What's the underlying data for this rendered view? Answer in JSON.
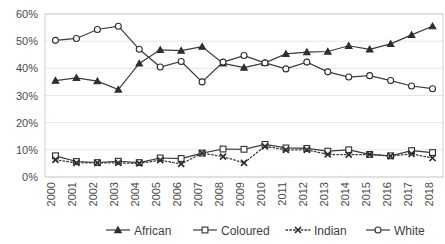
{
  "chart_data": {
    "type": "line",
    "title": "",
    "subtitle": "",
    "xlabel": "",
    "ylabel": "",
    "ylim": [
      0,
      60
    ],
    "ytick_labels": [
      "0%",
      "10%",
      "20%",
      "30%",
      "40%",
      "50%",
      "60%"
    ],
    "ytick_values": [
      0,
      10,
      20,
      30,
      40,
      50,
      60
    ],
    "grid": true,
    "legend_position": "bottom",
    "value_format": "percent",
    "categories": [
      "2000",
      "2001",
      "2002",
      "2003",
      "2004",
      "2005",
      "2006",
      "2007",
      "2008",
      "2009",
      "2010",
      "2011",
      "2012",
      "2013",
      "2014",
      "2015",
      "2016",
      "2017",
      "2018"
    ],
    "series": [
      {
        "name": "African",
        "marker": "triangle-filled",
        "line_style": "solid",
        "color": "#2e2e2e",
        "values": [
          35.5,
          36.5,
          35.3,
          32.2,
          41.8,
          46.8,
          46.5,
          48.0,
          41.8,
          40.3,
          42.0,
          45.3,
          46.0,
          46.2,
          48.3,
          47.0,
          49.0,
          52.3,
          55.5
        ]
      },
      {
        "name": "Coloured",
        "marker": "square-open",
        "line_style": "solid",
        "color": "#2e2e2e",
        "values": [
          7.8,
          5.7,
          5.3,
          5.8,
          5.3,
          7.0,
          6.8,
          8.8,
          10.3,
          10.2,
          12.0,
          10.7,
          10.5,
          9.5,
          10.0,
          8.3,
          7.8,
          9.7,
          9.0
        ]
      },
      {
        "name": "Indian",
        "marker": "x",
        "line_style": "dotted",
        "color": "#2e2e2e",
        "values": [
          6.3,
          5.2,
          5.2,
          5.2,
          5.0,
          6.2,
          4.8,
          8.8,
          7.5,
          5.2,
          11.3,
          10.0,
          10.0,
          8.3,
          8.2,
          8.3,
          7.7,
          8.5,
          7.0
        ]
      },
      {
        "name": "White",
        "marker": "circle-open",
        "line_style": "solid",
        "color": "#2e2e2e",
        "values": [
          50.3,
          51.0,
          54.3,
          55.5,
          47.0,
          40.5,
          42.5,
          35.0,
          42.3,
          44.7,
          42.0,
          39.8,
          42.3,
          38.7,
          36.8,
          37.3,
          35.5,
          33.5,
          32.5
        ]
      }
    ]
  }
}
